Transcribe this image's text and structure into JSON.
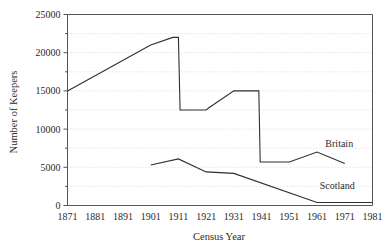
{
  "chart_data": {
    "type": "line",
    "title": "",
    "xlabel": "Census Year",
    "ylabel": "Number of Keepers",
    "x": [
      1871,
      1881,
      1891,
      1901,
      1911,
      1921,
      1931,
      1941,
      1951,
      1961,
      1971,
      1981
    ],
    "xlim": [
      1871,
      1981
    ],
    "ylim": [
      0,
      25000
    ],
    "ytick_labels": [
      "0",
      "5000",
      "10000",
      "15000",
      "20000",
      "25000"
    ],
    "ytick_values": [
      0,
      5000,
      10000,
      15000,
      20000,
      25000
    ],
    "yminor_values": [
      2500,
      7500,
      12500,
      17500,
      22500
    ],
    "xtick_labels": [
      "1871",
      "1881",
      "1891",
      "1901",
      "1911",
      "1921",
      "1931",
      "1941",
      "1951",
      "1961",
      "1971",
      "1981"
    ],
    "grid": "horizontal-dotted",
    "legend_position": "inline-right-annotations",
    "series": [
      {
        "name": "Britain",
        "label": "Britain",
        "points": [
          [
            1871,
            15000
          ],
          [
            1901,
            21000
          ],
          [
            1909,
            22000
          ],
          [
            1911,
            22000
          ],
          [
            1911.6,
            12500
          ],
          [
            1921,
            12500
          ],
          [
            1922,
            12800
          ],
          [
            1931,
            15000
          ],
          [
            1939,
            15000
          ],
          [
            1940,
            15000
          ],
          [
            1940.5,
            5700
          ],
          [
            1951,
            5700
          ],
          [
            1961,
            7000
          ],
          [
            1971,
            5500
          ]
        ]
      },
      {
        "name": "Scotland",
        "label": "Scotland",
        "points": [
          [
            1901,
            5300
          ],
          [
            1911,
            6100
          ],
          [
            1921,
            4400
          ],
          [
            1931,
            4200
          ],
          [
            1961,
            400
          ],
          [
            1971,
            400
          ],
          [
            1981,
            400
          ]
        ]
      }
    ],
    "annotations": [
      {
        "text": "Britain",
        "x": 1964,
        "y": 7700
      },
      {
        "text": "Scotland",
        "x": 1962,
        "y": 2100
      }
    ]
  }
}
